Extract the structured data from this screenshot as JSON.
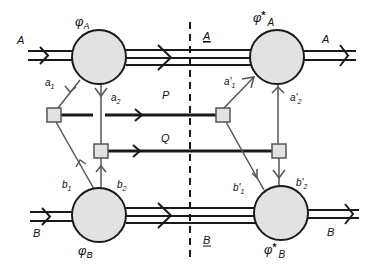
{
  "diagram": {
    "type": "Feynman-style double-line diagram",
    "colors": {
      "circle_fill": "#e2e2e2",
      "box_fill": "#e2e2e2",
      "line": "#1a1a1a",
      "thin_line": "#555555",
      "background": "#ffffff"
    },
    "nodes": {
      "phi_A": {
        "symbol": "φ",
        "sub": "A",
        "star": ""
      },
      "phi_A_star": {
        "symbol": "φ",
        "sup": "*",
        "sub": "A"
      },
      "phi_B": {
        "symbol": "φ",
        "sub": "B",
        "star": ""
      },
      "phi_B_star": {
        "symbol": "φ",
        "sup": "*",
        "sub": "B"
      }
    },
    "external_lines": {
      "A_left": "A",
      "A_right": "A",
      "B_left": "B",
      "B_right": "B"
    },
    "cut_labels": {
      "A_cut": "A",
      "B_cut": "B"
    },
    "exchange_lines": {
      "P": "P",
      "Q": "Q"
    },
    "internal_lines": {
      "a1": {
        "base": "a",
        "prime": "",
        "sub": "1"
      },
      "a2": {
        "base": "a",
        "prime": "",
        "sub": "2"
      },
      "b1": {
        "base": "b",
        "prime": "",
        "sub": "1"
      },
      "b2": {
        "base": "b",
        "prime": "",
        "sub": "2"
      },
      "a1p": {
        "base": "a",
        "prime": "'",
        "sub": "1"
      },
      "a2p": {
        "base": "a",
        "prime": "'",
        "sub": "2"
      },
      "b1p": {
        "base": "b",
        "prime": "'",
        "sub": "1"
      },
      "b2p": {
        "base": "b",
        "prime": "'",
        "sub": "2"
      }
    }
  }
}
